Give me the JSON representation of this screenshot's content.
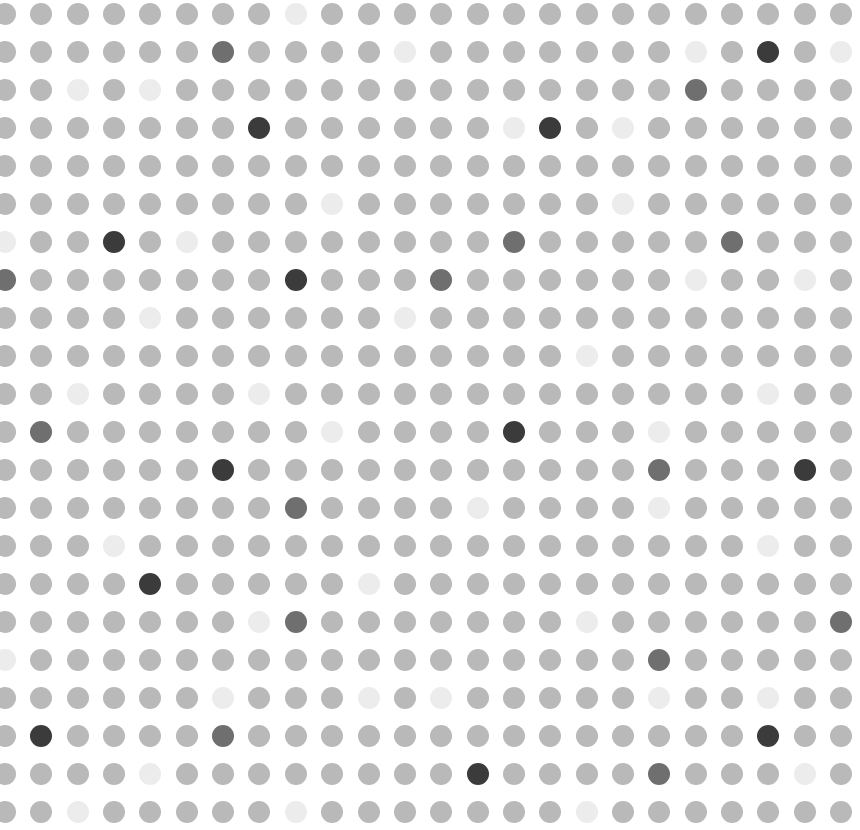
{
  "grid": {
    "rows": 22,
    "cols": 24,
    "origin_x": 5,
    "origin_y": 14,
    "pitch_x": 36.35,
    "pitch_y": 38,
    "dot_diameter": 22
  },
  "palette": {
    "n": "#b9b9b9",
    "l": "#ececec",
    "m": "#6f6f6f",
    "d": "#3b3b3b"
  },
  "rows": [
    "nnnnnnnnlnnnnnnnnnnnnnnn",
    "nnnnnnmnnnnlnnnnnnnlndnl",
    "nnlnlnnnnnnnnnnnnnnmnnnn",
    "nnnnnnndnnnnnnldnlnnnnnn",
    "nnnnnnnnnnnnnnnnnnnnnnnn",
    "nnnnnnnnnlnnnnnnnlnnnnnn",
    "lnndnlnnnnnnnnmnnnnnmnnn",
    "mnnnnnnndnnnmnnnnnnlnnln",
    "nnnnlnnnnnnlnnnnnnnnnnnn",
    "nnnnnnnnnnnnnnnnlnnnnnnn",
    "nnlnnnnlnnnnnnnnnnnnnlnn",
    "nmnnnnnnnlnnnndnnnlnnnnn",
    "nnnnnndnnnnnnnnnnnmnnndn",
    "nnnnnnnnmnnnnlnnnnlnnnnn",
    "nnnlnnnnnnnnnnnnnnnnnlnn",
    "nnnndnnnnnlnnnnnnnnnnnnn",
    "nnnnnnnlmnnnnnnnlnnnnnnm",
    "lnnnnnnnnnnnnnnnnnmnnnnn",
    "nnnnnnlnnnlnlnnnnnlnnlnn",
    "ndnnnnmnnnnnnnnnnnnnndnn",
    "nnnnlnnnnnnnndnnnnmnnnln",
    "nnlnnnnnlnnnnnnnlnnnnnnn"
  ]
}
